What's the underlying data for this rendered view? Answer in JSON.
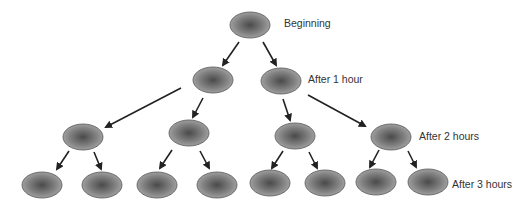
{
  "diagram": {
    "type": "binary-division-tree",
    "levels": [
      {
        "label": "Beginning",
        "count": 1
      },
      {
        "label": "After 1 hour",
        "count": 2
      },
      {
        "label": "After 2 hours",
        "count": 4
      },
      {
        "label": "After 3 hours",
        "count": 8
      }
    ],
    "labels": {
      "beginning": "Beginning",
      "after1": "After 1 hour",
      "after2": "After 2 hours",
      "after3": "After 3 hours"
    },
    "colors": {
      "cell_fill_center": "#4a4a4a",
      "cell_fill_edge": "#a8a8a8",
      "cell_stroke": "#555555",
      "arrow": "#222222"
    },
    "nodes": [
      {
        "id": "n0",
        "cx": 250,
        "cy": 25
      },
      {
        "id": "n1",
        "cx": 213,
        "cy": 80
      },
      {
        "id": "n2",
        "cx": 281,
        "cy": 81
      },
      {
        "id": "n3",
        "cx": 83,
        "cy": 137
      },
      {
        "id": "n4",
        "cx": 189,
        "cy": 133
      },
      {
        "id": "n5",
        "cx": 295,
        "cy": 136
      },
      {
        "id": "n6",
        "cx": 391,
        "cy": 137
      },
      {
        "id": "n7",
        "cx": 42,
        "cy": 185
      },
      {
        "id": "n8",
        "cx": 102,
        "cy": 185
      },
      {
        "id": "n9",
        "cx": 157,
        "cy": 185
      },
      {
        "id": "n10",
        "cx": 217,
        "cy": 185
      },
      {
        "id": "n11",
        "cx": 270,
        "cy": 183
      },
      {
        "id": "n12",
        "cx": 325,
        "cy": 183
      },
      {
        "id": "n13",
        "cx": 376,
        "cy": 182
      },
      {
        "id": "n14",
        "cx": 428,
        "cy": 182
      }
    ],
    "edges": [
      {
        "x1": 239,
        "y1": 42,
        "x2": 223,
        "y2": 65
      },
      {
        "x1": 263,
        "y1": 42,
        "x2": 276,
        "y2": 65
      },
      {
        "x1": 181,
        "y1": 88,
        "x2": 106,
        "y2": 127
      },
      {
        "x1": 203,
        "y1": 98,
        "x2": 193,
        "y2": 117
      },
      {
        "x1": 283,
        "y1": 99,
        "x2": 290,
        "y2": 120
      },
      {
        "x1": 308,
        "y1": 95,
        "x2": 365,
        "y2": 126
      },
      {
        "x1": 69,
        "y1": 151,
        "x2": 57,
        "y2": 169
      },
      {
        "x1": 94,
        "y1": 152,
        "x2": 101,
        "y2": 169
      },
      {
        "x1": 172,
        "y1": 150,
        "x2": 160,
        "y2": 168
      },
      {
        "x1": 200,
        "y1": 151,
        "x2": 209,
        "y2": 168
      },
      {
        "x1": 283,
        "y1": 151,
        "x2": 272,
        "y2": 168
      },
      {
        "x1": 309,
        "y1": 152,
        "x2": 317,
        "y2": 168
      },
      {
        "x1": 379,
        "y1": 150,
        "x2": 370,
        "y2": 167
      },
      {
        "x1": 408,
        "y1": 151,
        "x2": 416,
        "y2": 167
      }
    ]
  }
}
